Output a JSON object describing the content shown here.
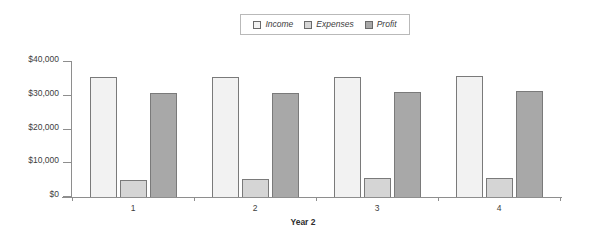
{
  "chart_data": {
    "type": "bar",
    "title": "",
    "xlabel": "Year 2",
    "ylabel": "",
    "categories": [
      "1",
      "2",
      "3",
      "4"
    ],
    "series": [
      {
        "name": "Income",
        "values": [
          35500,
          35500,
          35700,
          36000
        ],
        "color": "#f2f2f2"
      },
      {
        "name": "Expenses",
        "values": [
          5000,
          5300,
          5500,
          5600
        ],
        "color": "#d5d5d5"
      },
      {
        "name": "Profit",
        "values": [
          30700,
          30900,
          31200,
          31500
        ],
        "color": "#a8a8a8"
      }
    ],
    "ylim": [
      0,
      40000
    ],
    "ytick_labels": [
      "$0",
      "$10,000",
      "$20,000",
      "$30,000",
      "$40,000"
    ],
    "ytick_values": [
      0,
      10000,
      20000,
      30000,
      40000
    ],
    "grid": false,
    "legend_position": "top-center"
  },
  "legend": {
    "entries": [
      {
        "label": "Income"
      },
      {
        "label": "Expenses"
      },
      {
        "label": "Profit"
      }
    ]
  },
  "axis": {
    "x_title": "Year 2"
  },
  "colors": {
    "axis": "#8e8e8e",
    "bar_border": "#7a7a7a",
    "text": "#3d3d3d",
    "background": "#ffffff"
  }
}
